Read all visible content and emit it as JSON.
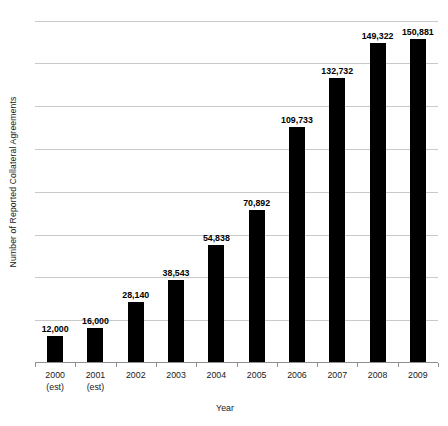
{
  "chart_data": {
    "type": "bar",
    "title": "",
    "xlabel": "Year",
    "ylabel": "Number of Reported Collateral Agreements",
    "categories": [
      "2000 (est)",
      "2001 (est)",
      "2002",
      "2003",
      "2004",
      "2005",
      "2006",
      "2007",
      "2008",
      "2009"
    ],
    "category_lines": [
      [
        "2000",
        "(est)"
      ],
      [
        "2001",
        "(est)"
      ],
      [
        "2002",
        ""
      ],
      [
        "2003",
        ""
      ],
      [
        "2004",
        ""
      ],
      [
        "2005",
        ""
      ],
      [
        "2006",
        ""
      ],
      [
        "2007",
        ""
      ],
      [
        "2008",
        ""
      ],
      [
        "2009",
        ""
      ]
    ],
    "values": [
      12000,
      16000,
      28140,
      38543,
      54838,
      70892,
      109733,
      132732,
      149322,
      150881
    ],
    "value_labels": [
      "12,000",
      "16,000",
      "28,140",
      "38,543",
      "54,838",
      "70,892",
      "109,733",
      "132,732",
      "149,322",
      "150,881"
    ],
    "ylim": [
      0,
      165000
    ],
    "gridline_values": [
      20000,
      40000,
      60000,
      80000,
      100000,
      120000,
      140000,
      160000
    ],
    "ytick_labels": [],
    "grid": true,
    "legend": false,
    "legend_position": "none",
    "bar_color": "#000000",
    "gridline_color": "#c9c9c9",
    "axis_color": "#8f8f8f",
    "background_color": "#ffffff"
  }
}
